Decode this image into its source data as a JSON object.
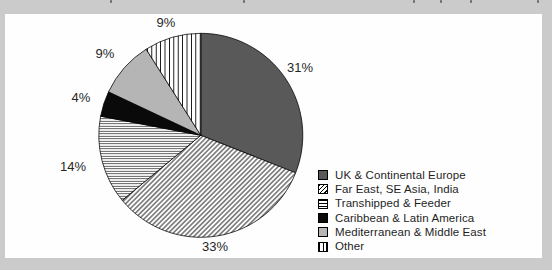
{
  "page": {
    "background_color": "#cbcbcb",
    "panel_color": "#fefefe"
  },
  "colors": {
    "slice_dark_gray": "#595959",
    "slice_light_gray": "#b5b5b5",
    "slice_black": "#0a0a0a",
    "hatch_line_color": "#000000",
    "label_text_color": "#262626"
  },
  "chart_data": {
    "type": "pie",
    "title": "",
    "direction": "clockwise",
    "start_angle_deg": 0,
    "legend_position": "right",
    "categories": [
      "UK & Continental Europe",
      "Far East, SE Asia, India",
      "Transhipped & Feeder",
      "Caribbean & Latin America",
      "Mediterranean & Middle East",
      "Other"
    ],
    "values": [
      31,
      33,
      14,
      4,
      9,
      9
    ],
    "slices": [
      {
        "label": "UK & Continental Europe",
        "value": 31,
        "display": "31%",
        "pattern": "solid-dark",
        "color": "#595959"
      },
      {
        "label": "Far East, SE Asia, India",
        "value": 33,
        "display": "33%",
        "pattern": "diagonal-hatch",
        "color": "#ffffff"
      },
      {
        "label": "Transhipped & Feeder",
        "value": 14,
        "display": "14%",
        "pattern": "horizontal-lines",
        "color": "#ffffff"
      },
      {
        "label": "Caribbean & Latin America",
        "value": 4,
        "display": "4%",
        "pattern": "solid-black",
        "color": "#0a0a0a"
      },
      {
        "label": "Mediterranean & Middle East",
        "value": 9,
        "display": "9%",
        "pattern": "solid-light",
        "color": "#b5b5b5"
      },
      {
        "label": "Other",
        "value": 9,
        "display": "9%",
        "pattern": "vertical-lines",
        "color": "#ffffff"
      }
    ]
  }
}
